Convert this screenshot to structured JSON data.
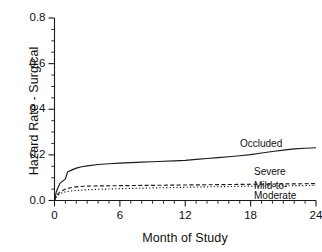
{
  "chart_data": {
    "type": "line",
    "title": "",
    "xlabel": "Month of Study",
    "ylabel": "Hazard Rate - Surgical",
    "xlim": [
      0,
      24
    ],
    "ylim": [
      0,
      0.8
    ],
    "grid": false,
    "legend_position": "inline-right",
    "xticks": [
      0,
      6,
      12,
      18,
      24
    ],
    "xticklabels": [
      "0",
      "6",
      "12",
      "18",
      "24"
    ],
    "x_minor_step": 1,
    "yticks": [
      0.0,
      0.2,
      0.4,
      0.6,
      0.8
    ],
    "yticklabels": [
      "0.0",
      "0.2",
      "0.4",
      "0.6",
      "0.8"
    ],
    "y_minor_step": 0.05,
    "series": [
      {
        "name": "Occluded",
        "style": "solid",
        "color": "#1a1a1a",
        "x": [
          0,
          0.15,
          0.3,
          0.5,
          0.75,
          1.0,
          1.2,
          1.5,
          2.0,
          2.5,
          3.0,
          4.0,
          5.0,
          6.0,
          7.0,
          8.0,
          9.0,
          10.0,
          11.0,
          12.0,
          13.0,
          14.0,
          15.0,
          16.0,
          17.0,
          18.0,
          19.0,
          20.0,
          21.0,
          22.0,
          23.0,
          24.0
        ],
        "values": [
          0.0,
          0.035,
          0.055,
          0.075,
          0.085,
          0.095,
          0.125,
          0.132,
          0.142,
          0.148,
          0.152,
          0.158,
          0.161,
          0.164,
          0.166,
          0.168,
          0.17,
          0.172,
          0.174,
          0.176,
          0.18,
          0.184,
          0.188,
          0.192,
          0.196,
          0.201,
          0.208,
          0.215,
          0.221,
          0.226,
          0.229,
          0.231
        ]
      },
      {
        "name": "Severe",
        "style": "dashed",
        "color": "#1a1a1a",
        "x": [
          0,
          0.2,
          0.5,
          1.0,
          1.5,
          2.0,
          3.0,
          4.0,
          6.0,
          8.0,
          10.0,
          12.0,
          14.0,
          16.0,
          18.0,
          20.0,
          22.0,
          24.0
        ],
        "values": [
          0.0,
          0.022,
          0.038,
          0.05,
          0.056,
          0.06,
          0.063,
          0.064,
          0.065,
          0.066,
          0.067,
          0.068,
          0.069,
          0.07,
          0.071,
          0.072,
          0.073,
          0.074
        ]
      },
      {
        "name": "Mild-to-Moderate",
        "style": "dotted",
        "color": "#1a1a1a",
        "x": [
          0,
          0.2,
          0.5,
          1.0,
          1.5,
          2.0,
          3.0,
          4.0,
          6.0,
          8.0,
          10.0,
          12.0,
          14.0,
          16.0,
          18.0,
          20.0,
          22.0,
          24.0
        ],
        "values": [
          0.0,
          0.018,
          0.03,
          0.038,
          0.042,
          0.044,
          0.047,
          0.049,
          0.052,
          0.054,
          0.056,
          0.058,
          0.06,
          0.061,
          0.063,
          0.064,
          0.065,
          0.066
        ]
      }
    ],
    "annotations": [
      {
        "text": "Occluded",
        "target": "Occluded"
      },
      {
        "text": "Severe",
        "target": "Severe"
      },
      {
        "text": "Mild-to-",
        "target": "Mild-to-Moderate"
      },
      {
        "text": "Moderate",
        "target": "Mild-to-Moderate"
      }
    ]
  },
  "axes": {
    "y_title": "Hazard Rate - Surgical",
    "x_title": "Month of Study",
    "y_tick_0": "0.0",
    "y_tick_1": "0.2",
    "y_tick_2": "0.4",
    "y_tick_3": "0.6",
    "y_tick_4": "0.8",
    "x_tick_0": "0",
    "x_tick_1": "6",
    "x_tick_2": "12",
    "x_tick_3": "18",
    "x_tick_4": "24"
  },
  "labels": {
    "occluded": "Occluded",
    "severe": "Severe",
    "mild_line1": "Mild-to-",
    "mild_line2": "Moderate"
  }
}
